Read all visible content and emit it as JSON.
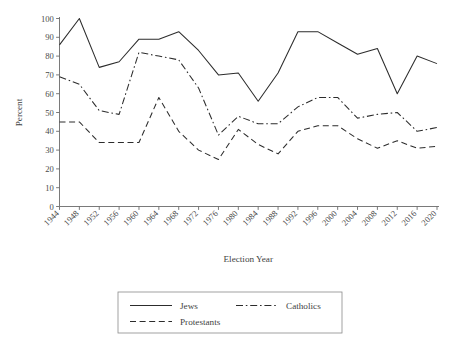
{
  "chart_data": {
    "type": "line",
    "title": "",
    "xlabel": "Election Year",
    "ylabel": "Percent",
    "xlim": [
      1944,
      2020
    ],
    "ylim": [
      0,
      100
    ],
    "ytick_step": 10,
    "grid": false,
    "legend_position": "bottom",
    "categories": [
      "1944",
      "1948",
      "1952",
      "1956",
      "1960",
      "1964",
      "1968",
      "1972",
      "1976",
      "1980",
      "1984",
      "1988",
      "1992",
      "1996",
      "2000",
      "2004",
      "2008",
      "2012",
      "2016",
      "2020"
    ],
    "yticks": [
      "0",
      "10",
      "20",
      "30",
      "40",
      "50",
      "60",
      "70",
      "80",
      "90",
      "100"
    ],
    "series": [
      {
        "name": "Jews",
        "style": "solid",
        "values": [
          86,
          100,
          74,
          77,
          89,
          89,
          93,
          83,
          70,
          71,
          56,
          71,
          93,
          93,
          87,
          81,
          84,
          60,
          80,
          76
        ]
      },
      {
        "name": "Catholics",
        "style": "dash-dot",
        "values": [
          69,
          65,
          51,
          49,
          82,
          80,
          78,
          63,
          38,
          48,
          44,
          44,
          53,
          58,
          58,
          47,
          49,
          50,
          40,
          42
        ]
      },
      {
        "name": "Protestants",
        "style": "dashed",
        "values": [
          45,
          45,
          34,
          34,
          34,
          58,
          40,
          30,
          25,
          41,
          33,
          28,
          40,
          43,
          43,
          36,
          31,
          35,
          31,
          32
        ]
      }
    ]
  },
  "legend": {
    "entries": [
      {
        "label": "Jews"
      },
      {
        "label": "Catholics"
      },
      {
        "label": "Protestants"
      }
    ]
  },
  "axes": {
    "y_title": "Percent",
    "x_title": "Election Year"
  }
}
